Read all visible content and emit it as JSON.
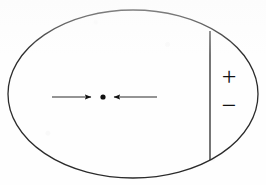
{
  "figure": {
    "background_color": "#fefefe",
    "ink_color": "#2b2b2b",
    "canvas": {
      "width": 266,
      "height": 185
    },
    "boundary": {
      "shape": "ellipse",
      "center_x": 133,
      "center_y": 94,
      "radius_x": 125,
      "radius_y": 84,
      "stroke_width": 1.3
    },
    "divider": {
      "label": "vertical-chord-line",
      "x": 210,
      "y_top": 31,
      "y_bottom": 160,
      "stroke_width": 1.3
    },
    "charge_point": {
      "label": "center-dot",
      "x": 103,
      "y": 97,
      "radius": 2.6
    },
    "arrows": [
      {
        "name": "left-arrow",
        "direction": "right",
        "tail_x": 52,
        "head_x": 91,
        "y": 97,
        "stroke_width": 1.1
      },
      {
        "name": "right-arrow",
        "direction": "left",
        "tail_x": 157,
        "head_x": 114,
        "y": 97,
        "stroke_width": 1.1
      }
    ],
    "signs": [
      {
        "name": "plus-sign",
        "symbol": "+",
        "x": 229,
        "y": 76,
        "font_size": 26
      },
      {
        "name": "minus-sign",
        "symbol": "−",
        "x": 229,
        "y": 105,
        "font_size": 26
      }
    ]
  }
}
